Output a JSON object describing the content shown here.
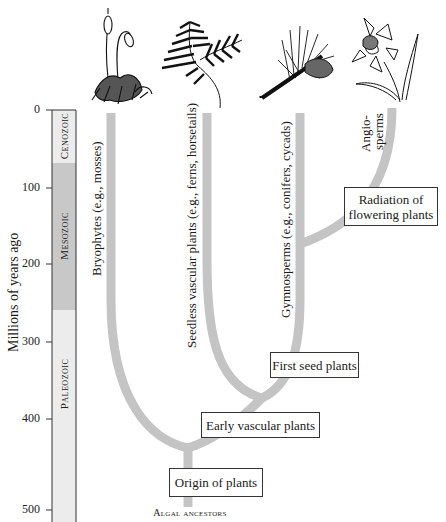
{
  "axis": {
    "label": "Millions of years ago",
    "ticks": [
      {
        "value": "0",
        "y": 110
      },
      {
        "value": "100",
        "y": 188
      },
      {
        "value": "200",
        "y": 264
      },
      {
        "value": "300",
        "y": 342
      },
      {
        "value": "400",
        "y": 419
      },
      {
        "value": "500",
        "y": 510
      }
    ]
  },
  "eras": [
    {
      "name": "Cenozoic",
      "from": 0,
      "to": 66,
      "color": "#ececec"
    },
    {
      "name": "Mesozoic",
      "from": 66,
      "to": 252,
      "color": "#c8c8c8"
    },
    {
      "name": "Paleozoic",
      "from": 252,
      "to": 520,
      "color": "#ececec"
    }
  ],
  "lineages": [
    {
      "label": "Bryophytes (e.g., mosses)",
      "icon": "moss-icon"
    },
    {
      "label": "Seedless vascular plants (e.g., ferns, horsetails)",
      "icon": "fern-icon"
    },
    {
      "label": "Gymnosperms (e.g., conifers, cycads)",
      "icon": "conifer-icon"
    },
    {
      "label": "Angio-\nsperms",
      "label_line1": "Angio-",
      "label_line2": "sperms",
      "icon": "flower-icon"
    }
  ],
  "events": {
    "radiation": "Radiation of flowering plants",
    "radiation_line1": "Radiation of",
    "radiation_line2": "flowering plants",
    "first_seed": "First seed plants",
    "early_vascular": "Early vascular plants",
    "origin": "Origin of plants"
  },
  "root_label": "Algal ancestors",
  "colors": {
    "branch": "#c4c4c4",
    "box_border": "#333333",
    "text": "#1a1a1a"
  }
}
